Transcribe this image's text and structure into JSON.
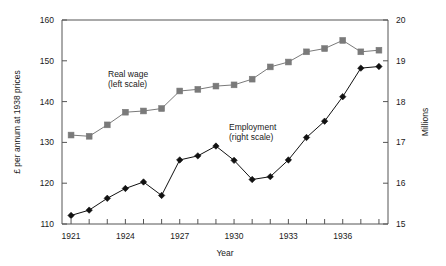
{
  "chart_data": {
    "type": "line",
    "title": "",
    "xlabel": "Year",
    "ylabel": "£ per annum at 1938 prices",
    "y2label": "Millions",
    "grid": false,
    "legend_position": "inline-annotations",
    "x": [
      1921,
      1922,
      1923,
      1924,
      1925,
      1926,
      1927,
      1928,
      1929,
      1930,
      1931,
      1932,
      1933,
      1934,
      1935,
      1936,
      1937,
      1938
    ],
    "xlim": [
      1920.5,
      1938.5
    ],
    "xticks": [
      1921,
      1922,
      1923,
      1924,
      1925,
      1926,
      1927,
      1928,
      1929,
      1930,
      1931,
      1932,
      1933,
      1934,
      1935,
      1936,
      1937,
      1938
    ],
    "xticklabels": [
      "1921",
      "",
      "",
      "1924",
      "",
      "",
      "1927",
      "",
      "",
      "1930",
      "",
      "",
      "1933",
      "",
      "",
      "1936",
      "",
      ""
    ],
    "ylim": [
      110,
      160
    ],
    "yticks": [
      110,
      120,
      130,
      140,
      150,
      160
    ],
    "yticklabels": [
      "110",
      "120",
      "130",
      "140",
      "150",
      "160"
    ],
    "y2lim": [
      15,
      20
    ],
    "y2ticks": [
      15,
      16,
      17,
      18,
      19,
      20
    ],
    "y2ticklabels": [
      "15",
      "16",
      "17",
      "18",
      "19",
      "20"
    ],
    "series": [
      {
        "name": "Real wage",
        "axis": "left",
        "marker": "square",
        "color": "#7a7a7a",
        "annotation_line1": "Real wage",
        "annotation_line2": "(left scale)",
        "values": [
          131.8,
          131.5,
          134.3,
          137.4,
          137.7,
          138.3,
          142.6,
          143.0,
          143.8,
          144.1,
          145.5,
          148.5,
          149.7,
          152.2,
          153.0,
          155.0,
          152.2,
          152.6
        ]
      },
      {
        "name": "Employment",
        "axis": "right",
        "marker": "diamond",
        "color": "#111111",
        "annotation_line1": "Employment",
        "annotation_line2": "(right scale)",
        "values": [
          15.21,
          15.34,
          15.63,
          15.87,
          16.03,
          15.7,
          16.57,
          16.67,
          16.91,
          16.56,
          16.09,
          16.16,
          16.57,
          17.12,
          17.52,
          18.12,
          18.82,
          18.86
        ]
      }
    ]
  }
}
